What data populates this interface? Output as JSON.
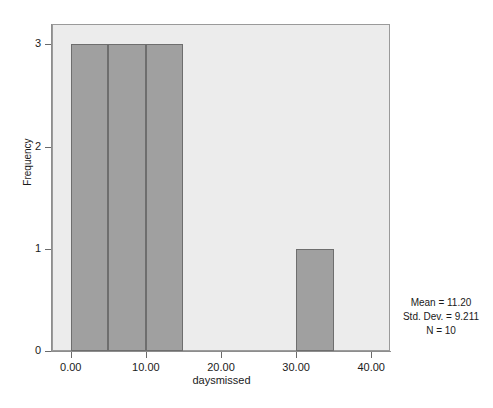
{
  "chart_data": {
    "type": "bar",
    "title": "",
    "subtitle": "",
    "xlabel": "daysmissed",
    "ylabel": "Frequency",
    "xlim": [
      -2.5,
      42.5
    ],
    "ylim": [
      0,
      3.2
    ],
    "grid": false,
    "legend": "none",
    "bin_width": 5,
    "categories": [
      "0-5",
      "5-10",
      "10-15",
      "15-20",
      "20-25",
      "25-30",
      "30-35",
      "35-40"
    ],
    "bin_edges": [
      0,
      5,
      10,
      15,
      20,
      25,
      30,
      35,
      40
    ],
    "values": [
      3,
      3,
      3,
      0,
      0,
      0,
      1,
      0
    ],
    "bars": [
      {
        "x0": 0,
        "x1": 5,
        "value": 3
      },
      {
        "x0": 5,
        "x1": 10,
        "value": 3
      },
      {
        "x0": 10,
        "x1": 15,
        "value": 3
      },
      {
        "x0": 30,
        "x1": 35,
        "value": 1
      }
    ],
    "xticks": [
      0,
      10,
      20,
      30,
      40
    ],
    "xtick_labels": [
      "0.00",
      "10.00",
      "20.00",
      "30.00",
      "40.00"
    ],
    "yticks": [
      0,
      1,
      2,
      3
    ],
    "ytick_labels": [
      "0",
      "1",
      "2",
      "3"
    ],
    "annotations": [
      "Mean = 11.20",
      "Std. Dev. = 9.211",
      "N = 10"
    ],
    "colors": {
      "bar_fill": "#a0a0a0",
      "bar_edge": "#6e6e6e",
      "plot_background": "#ececec",
      "figure_background": "#ffffff",
      "axis": "#8d8d8d",
      "text": "#1a1a1a"
    }
  },
  "stats": {
    "mean": "Mean = 11.20",
    "std_dev": "Std. Dev. = 9.211",
    "n": "N = 10"
  }
}
